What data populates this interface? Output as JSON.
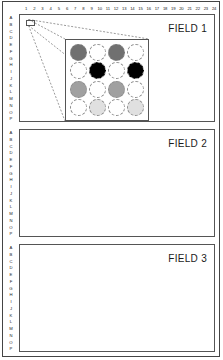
{
  "figure": {
    "column_ruler": [
      "1",
      "2",
      "3",
      "4",
      "5",
      "6",
      "7",
      "8",
      "9",
      "10",
      "11",
      "12",
      "13",
      "14",
      "15",
      "16",
      "17",
      "18",
      "19",
      "20",
      "21",
      "22",
      "23",
      "24"
    ],
    "row_letters": [
      "A",
      "B",
      "C",
      "D",
      "E",
      "F",
      "G",
      "H",
      "I",
      "J",
      "K",
      "L",
      "M",
      "N",
      "O",
      "P"
    ],
    "colors": {
      "frame": "#444444",
      "panel_border": "#555555",
      "text": "#1a1a1a",
      "disc_outline": "#8a8a8a",
      "dark_gray": "#707070",
      "black": "#000000",
      "mid_gray": "#a0a0a0",
      "white": "#ffffff",
      "light_gray": "#e0e0e0"
    },
    "fields": [
      {
        "label": "FIELD 1",
        "has_callout": true
      },
      {
        "label": "FIELD 2",
        "has_callout": false
      },
      {
        "label": "FIELD 3",
        "has_callout": false
      }
    ],
    "inset": {
      "rows": 4,
      "cols": 4,
      "cells": [
        [
          "#707070",
          "#ffffff",
          "#707070",
          "#ffffff"
        ],
        [
          "#ffffff",
          "#000000",
          "#ffffff",
          "#000000"
        ],
        [
          "#a0a0a0",
          "#ffffff",
          "#a0a0a0",
          "#ffffff"
        ],
        [
          "#ffffff",
          "#e0e0e0",
          "#ffffff",
          "#e0e0e0"
        ]
      ]
    }
  }
}
